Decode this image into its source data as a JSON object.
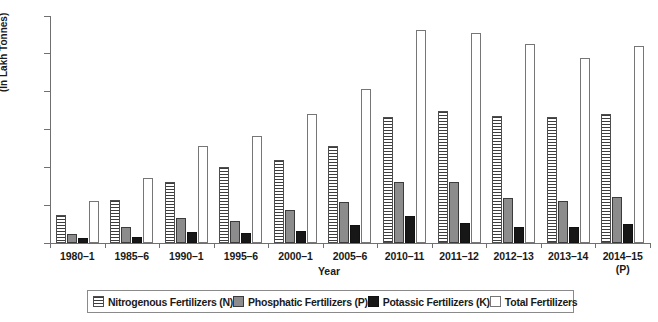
{
  "chart_data": {
    "type": "bar",
    "title": "",
    "xlabel": "Year",
    "ylabel": "(In Lakh Tonnes)",
    "ylim": [
      0,
      300
    ],
    "yticks": [
      0,
      50,
      100,
      150,
      200,
      250,
      300
    ],
    "grid": false,
    "legend_position": "bottom",
    "categories": [
      "1980–1",
      "1985–6",
      "1990–1",
      "1995–6",
      "2000–1",
      "2005–6",
      "2010–11",
      "2011–12",
      "2012–13",
      "2013–14",
      "2014–15"
    ],
    "category_sublabels": [
      "",
      "",
      "",
      "",
      "",
      "",
      "",
      "",
      "",
      "",
      "(P)"
    ],
    "series": [
      {
        "name": "Nitrogenous Fertilizers (N)",
        "key": "s-n",
        "values": [
          37,
          57,
          80,
          100,
          110,
          128,
          166,
          174,
          168,
          167,
          170
        ]
      },
      {
        "name": "Phosphatic Fertilizers (P)",
        "key": "s-p",
        "values": [
          12,
          21,
          33,
          29,
          44,
          54,
          81,
          80,
          60,
          56,
          61
        ]
      },
      {
        "name": "Potassic Fertilizers (K)",
        "key": "s-k",
        "values": [
          6,
          8,
          14,
          13,
          16,
          24,
          36,
          26,
          21,
          21,
          25
        ]
      },
      {
        "name": "Total Fertilizers",
        "key": "s-t",
        "values": [
          56,
          86,
          128,
          141,
          171,
          204,
          281,
          277,
          263,
          244,
          261
        ]
      }
    ]
  }
}
